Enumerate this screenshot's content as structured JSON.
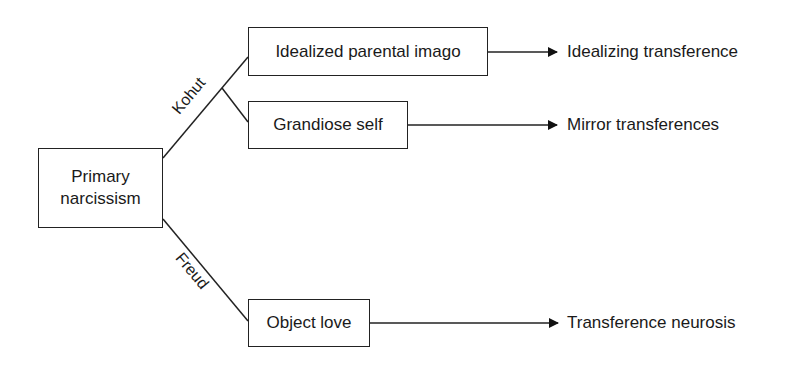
{
  "diagram": {
    "root": {
      "label_line1": "Primary",
      "label_line2": "narcissism"
    },
    "edges": {
      "kohut": "Kohut",
      "freud": "Freud"
    },
    "nodes": {
      "idealized": "Idealized parental imago",
      "grandiose": "Grandiose self",
      "object_love": "Object love"
    },
    "outcomes": {
      "idealizing": "Idealizing transference",
      "mirror": "Mirror transferences",
      "neurosis": "Transference neurosis"
    }
  }
}
